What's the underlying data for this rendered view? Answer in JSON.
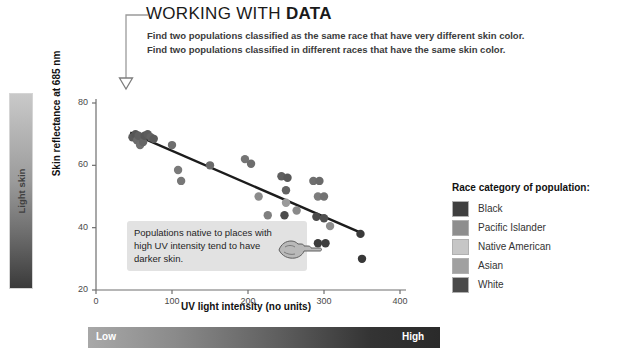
{
  "header": {
    "title_normal": "WORKING WITH ",
    "title_bold": "DATA",
    "prompt_line_1": "Find two populations classified as the same race that have very different skin color.",
    "prompt_line_2": "Find two populations classified in different races that have the same skin color."
  },
  "skin_bar": {
    "top_label": "Light skin",
    "bottom_label": "Dark skin"
  },
  "annotation": {
    "text": "Populations native to places with high UV intensity tend to have darker skin."
  },
  "legend": {
    "title": "Race category of population:",
    "items": [
      {
        "label": "Black",
        "color": "#3f3f3f"
      },
      {
        "label": "Pacific Islander",
        "color": "#8e8e8e"
      },
      {
        "label": "Native American",
        "color": "#c6c6c6"
      },
      {
        "label": "Asian",
        "color": "#a0a0a0"
      },
      {
        "label": "White",
        "color": "#4a4a4a"
      }
    ]
  },
  "uv_bar": {
    "low_label": "Low",
    "high_label": "High"
  },
  "chart_data": {
    "type": "scatter",
    "title": "",
    "xlabel": "UV light intensity (no units)",
    "ylabel": "Skin reflectance at 685 nm",
    "xlim": [
      0,
      400
    ],
    "ylim": [
      20,
      80
    ],
    "xticks": [
      0,
      100,
      200,
      300,
      400
    ],
    "yticks": [
      20,
      40,
      60,
      80
    ],
    "grid": false,
    "legend_position": "right",
    "trendline": {
      "x": [
        45,
        352
      ],
      "y": [
        70.5,
        38.0
      ]
    },
    "points": [
      {
        "x": 48,
        "y": 69.0,
        "color": "#5a5a5a"
      },
      {
        "x": 52,
        "y": 70.0,
        "color": "#565656"
      },
      {
        "x": 54,
        "y": 68.0,
        "color": "#6b6b6b"
      },
      {
        "x": 56,
        "y": 69.5,
        "color": "#5f5f5f"
      },
      {
        "x": 58,
        "y": 66.5,
        "color": "#707070"
      },
      {
        "x": 62,
        "y": 67.5,
        "color": "#666666"
      },
      {
        "x": 64,
        "y": 69.5,
        "color": "#575757"
      },
      {
        "x": 68,
        "y": 70.0,
        "color": "#5c5c5c"
      },
      {
        "x": 72,
        "y": 69.0,
        "color": "#626262"
      },
      {
        "x": 76,
        "y": 68.5,
        "color": "#5a5a5a"
      },
      {
        "x": 100,
        "y": 66.5,
        "color": "#6e6e6e"
      },
      {
        "x": 108,
        "y": 58.5,
        "color": "#7a7a7a"
      },
      {
        "x": 112,
        "y": 55.0,
        "color": "#777777"
      },
      {
        "x": 150,
        "y": 60.0,
        "color": "#6a6a6a"
      },
      {
        "x": 196,
        "y": 62.0,
        "color": "#747474"
      },
      {
        "x": 204,
        "y": 60.5,
        "color": "#6d6d6d"
      },
      {
        "x": 214,
        "y": 50.0,
        "color": "#8b8b8b"
      },
      {
        "x": 226,
        "y": 44.0,
        "color": "#7f7f7f"
      },
      {
        "x": 244,
        "y": 56.5,
        "color": "#5f5f5f"
      },
      {
        "x": 252,
        "y": 56.0,
        "color": "#585858"
      },
      {
        "x": 250,
        "y": 52.0,
        "color": "#636363"
      },
      {
        "x": 250,
        "y": 48.0,
        "color": "#9a9a9a"
      },
      {
        "x": 248,
        "y": 44.0,
        "color": "#4d4d4d"
      },
      {
        "x": 264,
        "y": 45.5,
        "color": "#8a8a8a"
      },
      {
        "x": 286,
        "y": 55.0,
        "color": "#6f6f6f"
      },
      {
        "x": 294,
        "y": 55.0,
        "color": "#6a6a6a"
      },
      {
        "x": 292,
        "y": 50.0,
        "color": "#7d7d7d"
      },
      {
        "x": 300,
        "y": 50.0,
        "color": "#727272"
      },
      {
        "x": 290,
        "y": 43.5,
        "color": "#4b4b4b"
      },
      {
        "x": 300,
        "y": 43.0,
        "color": "#4f4f4f"
      },
      {
        "x": 308,
        "y": 40.5,
        "color": "#8d8d8d"
      },
      {
        "x": 292,
        "y": 35.0,
        "color": "#3c3c3c"
      },
      {
        "x": 302,
        "y": 35.0,
        "color": "#3f3f3f"
      },
      {
        "x": 348,
        "y": 38.0,
        "color": "#3a3a3a"
      },
      {
        "x": 350,
        "y": 30.0,
        "color": "#383838"
      }
    ]
  }
}
